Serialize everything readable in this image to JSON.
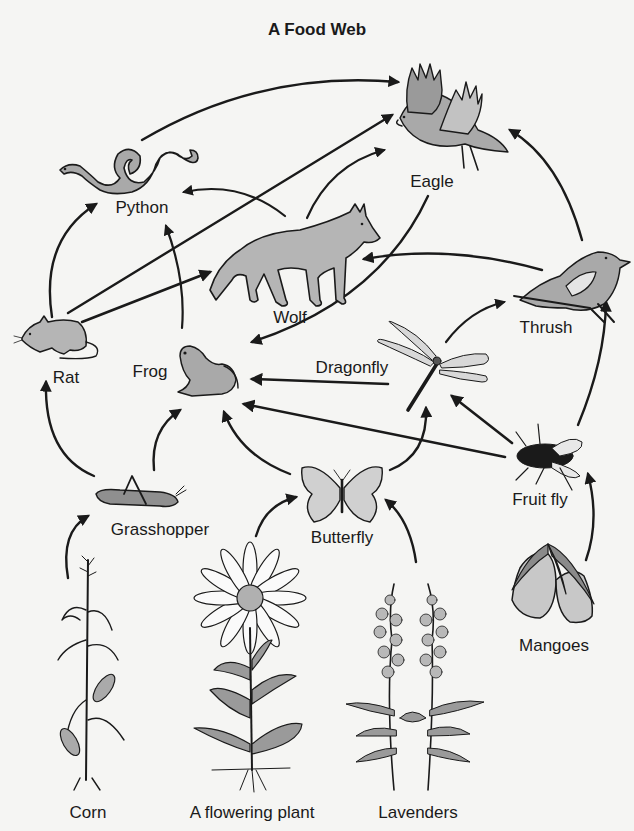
{
  "title": "A Food Web",
  "colors": {
    "background": "#f5f5f3",
    "ink": "#1a1a1a",
    "fill_gray": "#a9a9a9",
    "fill_light": "#c8c8c8"
  },
  "organisms": {
    "eagle": {
      "label": "Eagle",
      "x": 432,
      "y": 172
    },
    "python": {
      "label": "Python",
      "x": 142,
      "y": 198
    },
    "wolf": {
      "label": "Wolf",
      "x": 290,
      "y": 308
    },
    "thrush": {
      "label": "Thrush",
      "x": 546,
      "y": 318
    },
    "rat": {
      "label": "Rat",
      "x": 66,
      "y": 368
    },
    "frog": {
      "label": "Frog",
      "x": 150,
      "y": 362
    },
    "dragonfly": {
      "label": "Dragonfly",
      "x": 352,
      "y": 358
    },
    "fruit_fly": {
      "label": "Fruit fly",
      "x": 540,
      "y": 490
    },
    "grasshopper": {
      "label": "Grasshopper",
      "x": 160,
      "y": 520
    },
    "butterfly": {
      "label": "Butterfly",
      "x": 342,
      "y": 528
    },
    "mangoes": {
      "label": "Mangoes",
      "x": 554,
      "y": 636
    },
    "corn": {
      "label": "Corn",
      "x": 88,
      "y": 803
    },
    "flowering_plant": {
      "label": "A flowering plant",
      "x": 252,
      "y": 803
    },
    "lavenders": {
      "label": "Lavenders",
      "x": 418,
      "y": 803
    }
  },
  "links": [
    {
      "from": "Corn",
      "to": "Grasshopper"
    },
    {
      "from": "A flowering plant",
      "to": "Butterfly"
    },
    {
      "from": "Lavenders",
      "to": "Butterfly"
    },
    {
      "from": "Mangoes",
      "to": "Fruit fly"
    },
    {
      "from": "Grasshopper",
      "to": "Rat"
    },
    {
      "from": "Grasshopper",
      "to": "Frog"
    },
    {
      "from": "Butterfly",
      "to": "Frog"
    },
    {
      "from": "Butterfly",
      "to": "Dragonfly"
    },
    {
      "from": "Fruit fly",
      "to": "Frog"
    },
    {
      "from": "Fruit fly",
      "to": "Dragonfly"
    },
    {
      "from": "Fruit fly",
      "to": "Thrush"
    },
    {
      "from": "Dragonfly",
      "to": "Frog"
    },
    {
      "from": "Dragonfly",
      "to": "Thrush"
    },
    {
      "from": "Eagle",
      "to": "Frog"
    },
    {
      "from": "Rat",
      "to": "Python"
    },
    {
      "from": "Rat",
      "to": "Wolf"
    },
    {
      "from": "Rat",
      "to": "Eagle"
    },
    {
      "from": "Frog",
      "to": "Python"
    },
    {
      "from": "Frog",
      "to": "Wolf"
    },
    {
      "from": "Wolf",
      "to": "Python"
    },
    {
      "from": "Wolf",
      "to": "Eagle"
    },
    {
      "from": "Python",
      "to": "Eagle"
    },
    {
      "from": "Thrush",
      "to": "Wolf"
    },
    {
      "from": "Thrush",
      "to": "Eagle"
    }
  ]
}
